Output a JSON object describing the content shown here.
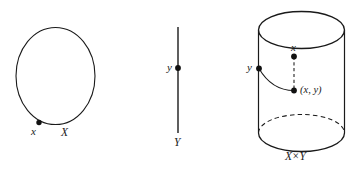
{
  "figure": {
    "caption_style": "mathematical-diagram",
    "stroke_color": "#1a1a1a",
    "background_color": "#ffffff",
    "panels": [
      {
        "name": "circle-panel",
        "shape": "circle",
        "space_label": "X",
        "point_label": "x",
        "point_position": "lower-left of circle"
      },
      {
        "name": "segment-panel",
        "shape": "vertical-line-segment",
        "space_label": "Y",
        "point_label": "y",
        "point_position": "upper portion of segment"
      },
      {
        "name": "cylinder-panel",
        "shape": "cylinder",
        "space_label_x": "X",
        "space_label_times": "×",
        "space_label_y": "Y",
        "product_label": "X × Y",
        "point_label_x": "x",
        "point_label_y": "y",
        "point_label_pair": "(x, y)"
      }
    ]
  },
  "labels": {
    "circle_point": "x",
    "circle_space": "X",
    "segment_point": "y",
    "segment_space": "Y",
    "cylinder_top_point": "x",
    "cylinder_side_point": "y",
    "cylinder_pair_point": "(x, y)",
    "cylinder_space_left": "X",
    "cylinder_space_times": "×",
    "cylinder_space_right": "Y"
  }
}
